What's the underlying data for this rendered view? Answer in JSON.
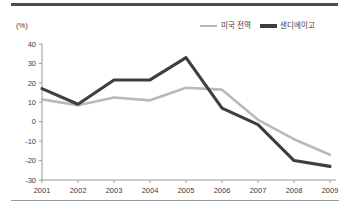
{
  "chart_data": {
    "type": "line",
    "title": "",
    "xlabel": "",
    "ylabel": "(%)",
    "unit_label": "(%)",
    "categories": [
      "2001",
      "2002",
      "2003",
      "2004",
      "2005",
      "2006",
      "2007",
      "2008",
      "2009"
    ],
    "x": [
      2001,
      2002,
      2003,
      2004,
      2005,
      2006,
      2007,
      2008,
      2009
    ],
    "ylim": [
      -30,
      40
    ],
    "yticks": [
      40,
      30,
      20,
      10,
      0,
      -10,
      -20,
      -30
    ],
    "ytick_labels": [
      "40",
      "30",
      "20",
      "10",
      "0",
      "-10",
      "-20",
      "-30"
    ],
    "grid": false,
    "legend_position": "top-right",
    "series": [
      {
        "name": "미국 전역",
        "color": "#b9b9b9",
        "values": [
          11.5,
          8.5,
          12.5,
          11,
          17.5,
          16.5,
          1,
          -9,
          -17
        ]
      },
      {
        "name": "샌디에이고",
        "color": "#3f3f3f",
        "values": [
          17,
          9,
          21.5,
          21.5,
          33,
          7,
          -1.5,
          -20,
          -23
        ]
      }
    ]
  },
  "legend": {
    "items": [
      {
        "label": "미국 전역",
        "swatch": "line-swatch-gray"
      },
      {
        "label": "샌디에이고",
        "swatch": "line-swatch-dark"
      }
    ]
  },
  "colors": {
    "series_us": "#b9b9b9",
    "series_sandiego": "#3f3f3f",
    "axis": "#9a9a9a",
    "rule_top": "#4d4d4d",
    "rule_bottom": "#9a9a9a",
    "text": "#3a3a3a",
    "background": "#ffffff"
  }
}
